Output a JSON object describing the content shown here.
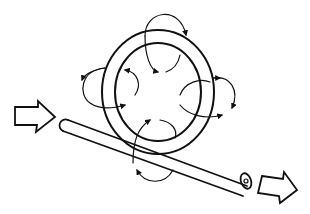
{
  "diagram": {
    "elements": [
      "ring",
      "rod",
      "field-loop-arrows",
      "input-arrow",
      "output-arrow"
    ],
    "colors": {
      "stroke": "#111111",
      "background": "#ffffff"
    }
  }
}
